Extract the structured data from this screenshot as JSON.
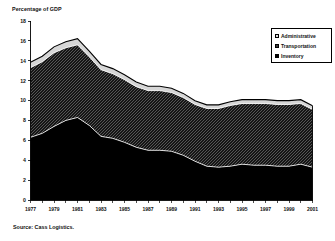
{
  "title": "Percentage of GDP",
  "source": "Source:  Cass Logistics.",
  "legend": {
    "items": [
      {
        "label": "Administrative",
        "swatch": "legend-swatch-administrative",
        "color": "#d9d9d9"
      },
      {
        "label": "Transportation",
        "swatch": "legend-swatch-transportation",
        "color": "#3a3a3a"
      },
      {
        "label": "Inventory",
        "swatch": "legend-swatch-inventory",
        "color": "#000000"
      }
    ]
  },
  "chart_data": {
    "type": "area",
    "stacked": true,
    "title": "Percentage of GDP",
    "xlabel": "",
    "ylabel": "Percentage of GDP",
    "ylim": [
      0,
      18
    ],
    "yticks": [
      0,
      2,
      4,
      6,
      8,
      10,
      12,
      14,
      16,
      18
    ],
    "ytick_labels": [
      "0",
      "2",
      "4",
      "6",
      "8",
      "10",
      "12",
      "14",
      "16",
      "18"
    ],
    "xlim": [
      1977,
      2001
    ],
    "x": [
      1977,
      1978,
      1979,
      1980,
      1981,
      1982,
      1983,
      1984,
      1985,
      1986,
      1987,
      1988,
      1989,
      1990,
      1991,
      1992,
      1993,
      1994,
      1995,
      1996,
      1997,
      1998,
      1999,
      2000,
      2001
    ],
    "xtick_labels": [
      "1977",
      "1979",
      "1981",
      "1983",
      "1985",
      "1987",
      "1989",
      "1991",
      "1993",
      "1995",
      "1997",
      "1999",
      "2001"
    ],
    "xtick_values": [
      1977,
      1979,
      1981,
      1983,
      1985,
      1987,
      1989,
      1991,
      1993,
      1995,
      1997,
      1999,
      2001
    ],
    "xtick_minor_every": 1,
    "grid": false,
    "legend_position": "upper right",
    "series": [
      {
        "name": "Inventory",
        "color": "#000000",
        "values": [
          6.3,
          6.7,
          7.4,
          8.0,
          8.3,
          7.5,
          6.4,
          6.2,
          5.8,
          5.3,
          5.0,
          5.0,
          4.9,
          4.5,
          3.9,
          3.4,
          3.3,
          3.4,
          3.6,
          3.5,
          3.5,
          3.4,
          3.4,
          3.6,
          3.3
        ]
      },
      {
        "name": "Transportation",
        "color": "#3a3a3a",
        "values": [
          7.0,
          7.2,
          7.4,
          7.3,
          7.3,
          6.9,
          6.7,
          6.5,
          6.3,
          6.1,
          6.0,
          6.0,
          5.9,
          5.8,
          5.7,
          5.8,
          5.9,
          6.1,
          6.1,
          6.2,
          6.2,
          6.2,
          6.2,
          6.1,
          5.8
        ]
      },
      {
        "name": "Administrative",
        "color": "#d9d9d9",
        "values": [
          0.55,
          0.56,
          0.6,
          0.62,
          0.63,
          0.58,
          0.53,
          0.51,
          0.49,
          0.46,
          0.44,
          0.44,
          0.44,
          0.42,
          0.39,
          0.37,
          0.37,
          0.38,
          0.39,
          0.39,
          0.39,
          0.39,
          0.39,
          0.39,
          0.37
        ]
      }
    ],
    "totals": [
      13.85,
      14.46,
      15.4,
      15.92,
      16.23,
      14.98,
      13.63,
      13.21,
      12.59,
      11.86,
      11.44,
      11.44,
      11.24,
      10.72,
      9.99,
      9.57,
      9.57,
      9.88,
      10.09,
      10.09,
      10.09,
      9.99,
      9.99,
      10.09,
      9.47
    ]
  }
}
